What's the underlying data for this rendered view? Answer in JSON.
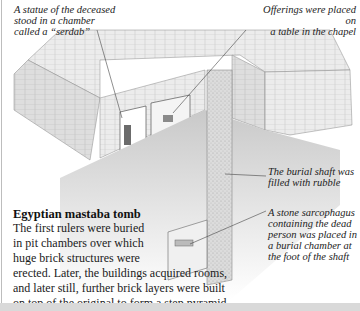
{
  "figure": {
    "title": "Egyptian mastaba tomb",
    "body_lines": [
      "The first rulers were buried",
      "in pit chambers over which",
      "huge brick structures were",
      "erected. Later, the buildings acquired rooms,",
      "and later still, further brick layers were built",
      "on top of the original to form a step pyramid."
    ],
    "callouts": {
      "serdab": [
        "A statue of the deceased",
        "stood in a chamber",
        "called a “serdab”"
      ],
      "offerings": [
        "Offerings were placed on",
        "a table in the chapel"
      ],
      "shaft": [
        "The burial shaft was",
        "filled with rubble"
      ],
      "sarcophagus": [
        "A stone sarcophagus",
        "containing the dead",
        "person was placed in",
        "a burial chamber at",
        "the foot of the shaft"
      ]
    }
  },
  "colors": {
    "brick_light": "#e9e9e9",
    "brick_mid": "#cfcfcf",
    "shadow": "#b8b8b8",
    "line": "#444444"
  }
}
